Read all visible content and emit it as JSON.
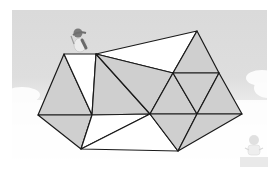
{
  "figure": {
    "colors": {
      "sky": "#dcdcdc",
      "snow": "#ffffff",
      "shaded": "#cfcfcf",
      "unshaded": "#ffffff",
      "edge": "#1a1a1a",
      "penguin": "#8a8a8a"
    },
    "vertices": {
      "A": [
        64,
        54
      ],
      "B": [
        96,
        54
      ],
      "C": [
        197,
        31
      ],
      "D": [
        173,
        73
      ],
      "E": [
        219,
        73
      ],
      "F": [
        38,
        115
      ],
      "G": [
        92,
        115
      ],
      "H": [
        150,
        114
      ],
      "I": [
        197,
        114
      ],
      "J": [
        242,
        114
      ],
      "K": [
        81,
        149
      ],
      "L": [
        178,
        151
      ]
    },
    "triangles": [
      {
        "pts": "A F G",
        "shaded": true
      },
      {
        "pts": "A B G",
        "shaded": false
      },
      {
        "pts": "B G H",
        "shaded": true
      },
      {
        "pts": "B C D",
        "shaded": false
      },
      {
        "pts": "B D H",
        "shaded": true
      },
      {
        "pts": "C D E",
        "shaded": true
      },
      {
        "pts": "D H I",
        "shaded": true
      },
      {
        "pts": "D E I",
        "shaded": true
      },
      {
        "pts": "E I J",
        "shaded": true
      },
      {
        "pts": "F G K",
        "shaded": true
      },
      {
        "pts": "G H K",
        "shaded": false
      },
      {
        "pts": "H K L",
        "shaded": false
      },
      {
        "pts": "H I L",
        "shaded": true
      },
      {
        "pts": "I J L",
        "shaded": true
      }
    ],
    "shaded_count": 10,
    "unshaded_count": 4
  }
}
